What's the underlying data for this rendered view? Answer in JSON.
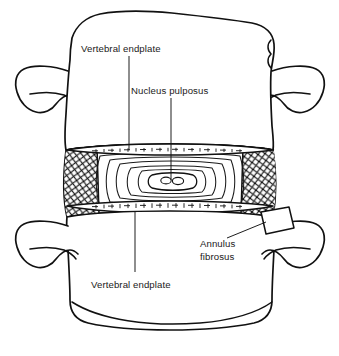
{
  "figure": {
    "background_color": "#ffffff",
    "ink_color": "#111111",
    "width": 339,
    "height": 356
  },
  "labels": {
    "vertebral_endplate_top": "Vertebral endplate",
    "nucleus_pulposus": "Nucleus pulposus",
    "annulus_fibrosus_line1": "Annulus",
    "annulus_fibrosus_line2": "fibrosus",
    "vertebral_endplate_bottom": "Vertebral endplate"
  },
  "structures": {
    "upper_vertebral_body": "upper vertebral body",
    "lower_vertebral_body": "lower vertebral body",
    "upper_left_transverse_process": "upper left transverse process",
    "upper_right_transverse_process": "upper right transverse process",
    "lower_left_transverse_process": "lower left transverse process",
    "lower_right_transverse_process": "lower right transverse process",
    "intervertebral_disc": "intervertebral disc",
    "annulus_left_hatching": "left annulus cross-hatched lamellae",
    "annulus_right_hatching": "right annulus cross-hatched lamellae",
    "superior_endplate": "superior cartilaginous endplate band",
    "inferior_endplate": "inferior cartilaginous endplate band",
    "lamellar_rings": "concentric annular lamellae",
    "nucleus_core": "nucleus pulposus core"
  }
}
